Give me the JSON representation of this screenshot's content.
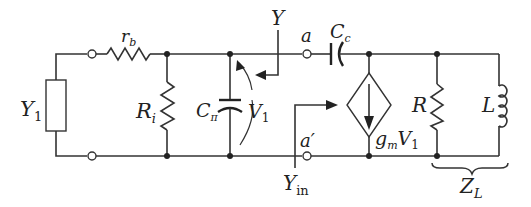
{
  "diagram": {
    "type": "circuit-schematic",
    "colors": {
      "line": "#333333",
      "background": "#ffffff"
    },
    "labels": {
      "Y1": {
        "main": "Y",
        "sub": "1"
      },
      "rb": {
        "main": "r",
        "sub": "b"
      },
      "Ri": {
        "main": "R",
        "sub": "i"
      },
      "Cpi": {
        "main": "C",
        "sub": "π"
      },
      "V1": {
        "main": "V",
        "sub": "1"
      },
      "Y": {
        "main": "Y"
      },
      "a": {
        "main": "a"
      },
      "a_prime": {
        "main": "a′"
      },
      "Cc": {
        "main": "C",
        "sub": "c"
      },
      "Yin": {
        "main": "Y",
        "sub": "in"
      },
      "gmV1": {
        "g": "g",
        "gsub": "m",
        "v": "V",
        "vsub": "1"
      },
      "R": {
        "main": "R"
      },
      "L": {
        "main": "L"
      },
      "ZL": {
        "main": "Z",
        "sub": "L"
      }
    },
    "components": [
      {
        "id": "Y1",
        "kind": "admittance-box"
      },
      {
        "id": "rb",
        "kind": "resistor",
        "orientation": "horizontal"
      },
      {
        "id": "Ri",
        "kind": "resistor",
        "orientation": "vertical"
      },
      {
        "id": "Cpi",
        "kind": "capacitor",
        "orientation": "vertical"
      },
      {
        "id": "Cc",
        "kind": "capacitor",
        "orientation": "horizontal"
      },
      {
        "id": "gmV1",
        "kind": "dependent-current-source",
        "direction": "down"
      },
      {
        "id": "R",
        "kind": "resistor",
        "orientation": "vertical"
      },
      {
        "id": "L",
        "kind": "inductor",
        "orientation": "vertical"
      }
    ],
    "terminals": [
      "a",
      "a′"
    ]
  }
}
